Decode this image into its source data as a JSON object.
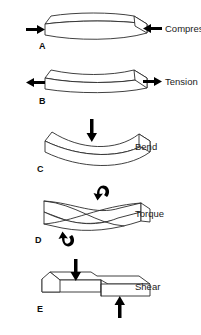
{
  "figure": {
    "background_color": "#ffffff",
    "line_color": "#2b2b2b",
    "arrow_color": "#000000",
    "text_color": "#1a1a1a"
  },
  "rows": [
    {
      "letter": "A",
      "label": "Compression",
      "deformation": "barrel-bulged block",
      "arrow_directions": "inward from both ends, horizontal"
    },
    {
      "letter": "B",
      "label": "Tension",
      "deformation": "necked / waisted block",
      "arrow_directions": "outward from both ends, horizontal"
    },
    {
      "letter": "C",
      "label": "Bend",
      "deformation": "downward curved block",
      "arrow_directions": "single downward arrow at center top"
    },
    {
      "letter": "D",
      "label": "Torque",
      "deformation": "twisted block",
      "arrow_directions": "two curved rotation arrows, top right and bottom left"
    },
    {
      "letter": "E",
      "label": "Shear",
      "deformation": "offset stepped block",
      "arrow_directions": "downward arrow at top left, upward arrow at bottom right"
    }
  ]
}
